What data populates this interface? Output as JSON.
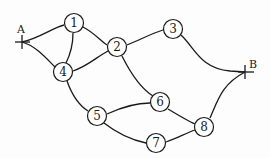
{
  "diagram": {
    "type": "network-graph",
    "terminals": [
      {
        "id": "A",
        "label": "A",
        "x": 22,
        "y": 42
      },
      {
        "id": "B",
        "label": "B",
        "x": 245,
        "y": 72
      }
    ],
    "nodes": [
      {
        "id": "1",
        "label": "1",
        "x": 74,
        "y": 23
      },
      {
        "id": "2",
        "label": "2",
        "x": 117,
        "y": 47
      },
      {
        "id": "3",
        "label": "3",
        "x": 173,
        "y": 29
      },
      {
        "id": "4",
        "label": "4",
        "x": 63,
        "y": 72
      },
      {
        "id": "5",
        "label": "5",
        "x": 97,
        "y": 116
      },
      {
        "id": "6",
        "label": "6",
        "x": 160,
        "y": 103
      },
      {
        "id": "7",
        "label": "7",
        "x": 156,
        "y": 143
      },
      {
        "id": "8",
        "label": "8",
        "x": 204,
        "y": 127
      }
    ],
    "edges": [
      [
        "A",
        "1"
      ],
      [
        "A",
        "4"
      ],
      [
        "1",
        "4"
      ],
      [
        "1",
        "2"
      ],
      [
        "4",
        "2"
      ],
      [
        "2",
        "3"
      ],
      [
        "3",
        "B"
      ],
      [
        "2",
        "6"
      ],
      [
        "4",
        "5"
      ],
      [
        "5",
        "6"
      ],
      [
        "5",
        "7"
      ],
      [
        "6",
        "8"
      ],
      [
        "7",
        "8"
      ],
      [
        "8",
        "B"
      ]
    ]
  }
}
